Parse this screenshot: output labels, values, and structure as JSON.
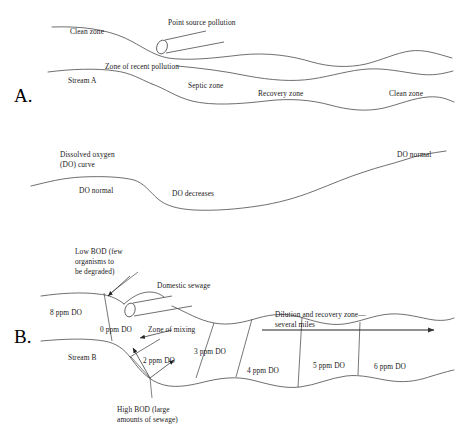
{
  "figure": {
    "background_color": "#ffffff",
    "line_color": "#4a4a4a",
    "text_color": "#1a1a1a"
  },
  "panel_a": {
    "letter": "A.",
    "labels": {
      "clean_zone_left": "Clean zone",
      "point_source": "Point source pollution",
      "zone_recent_pollution": "Zone of recent pollution",
      "stream_a": "Stream A",
      "septic_zone": "Septic zone",
      "recovery_zone": "Recovery zone",
      "clean_zone_right": "Clean zone"
    }
  },
  "do_curve": {
    "labels": {
      "title_line1": "Dissolved oxygen",
      "title_line2": "(DO) curve",
      "do_normal_left": "DO normal",
      "do_decreases": "DO decreases",
      "do_normal_right": "DO normal"
    }
  },
  "panel_b": {
    "letter": "B.",
    "labels": {
      "low_bod_line1": "Low BOD (few",
      "low_bod_line2": "organisms to",
      "low_bod_line3": "be degraded)",
      "domestic_sewage": "Domestic sewage",
      "zone_of_mixing": "Zone of mixing",
      "stream_b": "Stream B",
      "dilution_line1": "Dilution and recovery zone—",
      "dilution_line2": "several miles",
      "high_bod_line1": "High BOD (large",
      "high_bod_line2": "amounts of sewage)"
    },
    "do_readings": [
      {
        "label": "8 ppm DO",
        "value": 8,
        "unit": "ppm"
      },
      {
        "label": "0 ppm DO",
        "value": 0,
        "unit": "ppm"
      },
      {
        "label": "2 ppm DO",
        "value": 2,
        "unit": "ppm"
      },
      {
        "label": "3 ppm DO",
        "value": 3,
        "unit": "ppm"
      },
      {
        "label": "4 ppm DO",
        "value": 4,
        "unit": "ppm"
      },
      {
        "label": "5 ppm DO",
        "value": 5,
        "unit": "ppm"
      },
      {
        "label": "6 ppm DO",
        "value": 6,
        "unit": "ppm"
      }
    ]
  }
}
